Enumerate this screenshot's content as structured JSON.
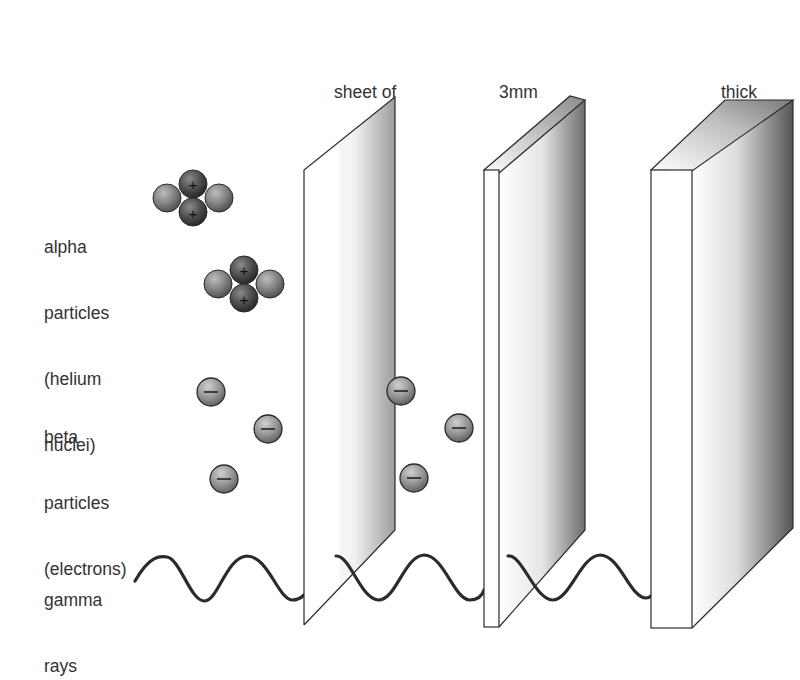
{
  "diagram": {
    "radiation_labels": {
      "alpha": [
        "alpha",
        "particles",
        "(helium",
        "nuclei)"
      ],
      "beta": [
        "beta",
        "particles",
        "(electrons)"
      ],
      "gamma": [
        "gamma",
        "rays"
      ]
    },
    "barrier_labels": {
      "paper": [
        "sheet of",
        "paper"
      ],
      "aluminium": [
        "3mm",
        "aluminium"
      ],
      "lead": [
        "thick",
        "lead"
      ]
    },
    "symbols": {
      "proton_charge": "+",
      "electron_charge": "−"
    },
    "nodes": [
      {
        "id": "alpha",
        "label": "alpha particles (helium nuclei)",
        "stopped_by": "paper"
      },
      {
        "id": "beta",
        "label": "beta particles (electrons)",
        "stopped_by": "aluminium"
      },
      {
        "id": "gamma",
        "label": "gamma rays",
        "stopped_by": "lead"
      },
      {
        "id": "paper",
        "label": "sheet of paper"
      },
      {
        "id": "aluminium",
        "label": "3mm aluminium"
      },
      {
        "id": "lead",
        "label": "thick lead"
      }
    ],
    "colors": {
      "outline": "#2b2b2b",
      "neutron": "#7d7d7d",
      "proton": "#4a4a4a",
      "electron": "#8a8a8a",
      "shade_dark": "#6a6a6a",
      "text": "#333333"
    }
  }
}
